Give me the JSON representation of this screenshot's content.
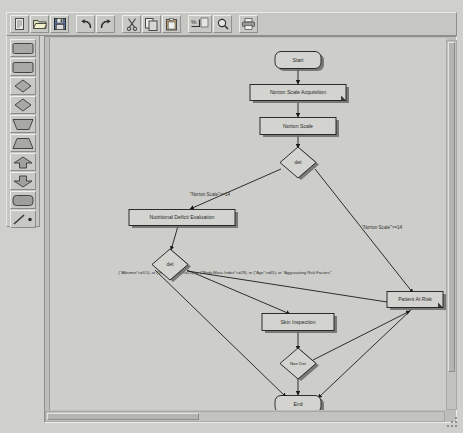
{
  "window": {
    "background_color": "#cfcfcb"
  },
  "toolbar": {
    "name": "main-toolbar",
    "buttons": [
      {
        "id": "new",
        "icon": "new-document-icon",
        "label": "New"
      },
      {
        "id": "open",
        "icon": "open-folder-icon",
        "label": "Open"
      },
      {
        "id": "save",
        "icon": "save-disk-icon",
        "label": "Save"
      },
      {
        "id": "undo",
        "icon": "undo-arrow-icon",
        "label": "Undo"
      },
      {
        "id": "redo",
        "icon": "redo-arrow-icon",
        "label": "Redo"
      },
      {
        "id": "cut",
        "icon": "scissors-icon",
        "label": "Cut"
      },
      {
        "id": "copy",
        "icon": "copy-pages-icon",
        "label": "Copy"
      },
      {
        "id": "paste",
        "icon": "clipboard-icon",
        "label": "Paste"
      },
      {
        "id": "zoom-fit",
        "icon": "zoom-fit-icon",
        "label": "Zoom To Fit"
      },
      {
        "id": "zoom",
        "icon": "magnifier-icon",
        "label": "Zoom"
      },
      {
        "id": "print",
        "icon": "printer-icon",
        "label": "Print"
      }
    ]
  },
  "palette": {
    "name": "shape-palette",
    "buttons": [
      {
        "id": "rect-1",
        "icon": "rectangle-shape-icon",
        "label": "Rectangle"
      },
      {
        "id": "rect-2",
        "icon": "rectangle-shape-icon",
        "label": "Rectangle"
      },
      {
        "id": "diamond-1",
        "icon": "diamond-shape-icon",
        "label": "Decision"
      },
      {
        "id": "diamond-2",
        "icon": "diamond-shape-icon",
        "label": "Decision"
      },
      {
        "id": "trap-1",
        "icon": "trapezoid-shape-icon",
        "label": "Trapezoid"
      },
      {
        "id": "trap-2",
        "icon": "trapezoid-shape-icon",
        "label": "Trapezoid"
      },
      {
        "id": "up-1",
        "icon": "up-arrow-shape-icon",
        "label": "Up Arrow"
      },
      {
        "id": "down-1",
        "icon": "down-arrow-shape-icon",
        "label": "Down Arrow"
      },
      {
        "id": "rounded-1",
        "icon": "rounded-rectangle-shape-icon",
        "label": "Rounded Rectangle"
      },
      {
        "id": "line-dot",
        "icon": "line-and-point-icon",
        "label": "Line"
      }
    ]
  },
  "scrollbars": {
    "horizontal_name": "horizontal-scrollbar",
    "vertical_name": "vertical-scrollbar"
  },
  "diagram": {
    "name": "flowchart-canvas",
    "nodes": [
      {
        "id": "start",
        "label": "Start",
        "shape": "rounded",
        "x": 248,
        "y": 22,
        "w": 46,
        "h": 17
      },
      {
        "id": "nsa",
        "label": "Norton Scale Acquisition",
        "shape": "process",
        "x": 248,
        "y": 55,
        "w": 96,
        "h": 16
      },
      {
        "id": "ns",
        "label": "Norton Scale",
        "shape": "rect",
        "x": 248,
        "y": 88,
        "w": 76,
        "h": 17
      },
      {
        "id": "det1",
        "label": "det",
        "shape": "diamond",
        "x": 248,
        "y": 124,
        "w": 34,
        "h": 26
      },
      {
        "id": "nde",
        "label": "Nutritional Deficit Evaluation",
        "shape": "rect",
        "x": 132,
        "y": 180,
        "w": 106,
        "h": 16
      },
      {
        "id": "det2",
        "label": "det",
        "shape": "diamond",
        "x": 120,
        "y": 225,
        "w": 34,
        "h": 26
      },
      {
        "id": "skin",
        "label": "Skin Inspection",
        "shape": "rect",
        "x": 248,
        "y": 284,
        "w": 72,
        "h": 17
      },
      {
        "id": "nondet",
        "label": "Non Det",
        "shape": "diamond",
        "x": 248,
        "y": 325,
        "w": 34,
        "h": 26
      },
      {
        "id": "risk",
        "label": "Patient At Risk",
        "shape": "process",
        "x": 365,
        "y": 262,
        "w": 56,
        "h": 16
      },
      {
        "id": "end",
        "label": "End",
        "shape": "rounded",
        "x": 248,
        "y": 366,
        "w": 46,
        "h": 17
      }
    ],
    "edge_labels": [
      {
        "id": "cond-low",
        "text": "\"Norton Scale\"<=14",
        "x": 160,
        "y": 158
      },
      {
        "id": "cond-high",
        "text": "\"Norton Scale\">=14",
        "x": 330,
        "y": 191
      },
      {
        "id": "cond-nutri",
        "text": "(\"Albumin\"<=3.5), or (\"Hemoglobin\"<=11), or (\"Body Mass Index\"<=19), or (\"Age\">=65), or \"Aggravating Risk Factors\"",
        "x": 170,
        "y": 236
      }
    ]
  }
}
